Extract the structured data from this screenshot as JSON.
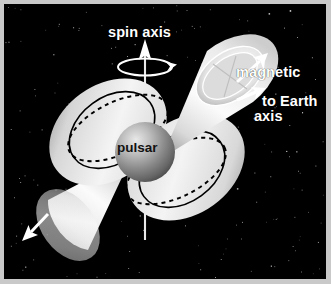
{
  "figure": {
    "background_color": "#000000",
    "frame_color": "#c9c9c9",
    "text_color": "#ffffff"
  },
  "labels": {
    "spin_axis": "spin axis",
    "magnetic_axis_line1": "magnetic",
    "magnetic_axis_line2": "axis",
    "to_earth": "to Earth",
    "pulsar": "pulsar"
  },
  "diagram": {
    "object_name": "pulsar",
    "sphere_color_light": "#e8e8e8",
    "sphere_color_dark": "#5a5a5a",
    "beam_color": "#f2f2f2",
    "field_line_color": "#000000",
    "arrow_color": "#ffffff",
    "spin_axis_tilt_deg": 0,
    "magnetic_axis_tilt_deg": 35,
    "beams": [
      {
        "name": "upper-right-beam",
        "direction": "up-right"
      },
      {
        "name": "lower-left-beam",
        "direction": "down-left"
      }
    ],
    "arrows": [
      {
        "name": "spin-axis-arrow",
        "direction": "up"
      },
      {
        "name": "rotation-direction-arrow",
        "direction": "counterclockwise"
      },
      {
        "name": "magnetic-axis-arrow",
        "direction": "up-right"
      },
      {
        "name": "to-earth-arrow",
        "direction": "right"
      },
      {
        "name": "lower-beam-arrow",
        "direction": "down-left"
      }
    ],
    "field_lobes": [
      "upper-left-lobe",
      "lower-right-lobe"
    ],
    "star_count": 190
  }
}
